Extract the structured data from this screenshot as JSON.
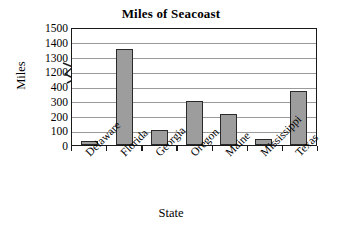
{
  "chart_data": {
    "type": "bar",
    "title": "Miles of Seacoast",
    "xlabel": "State",
    "ylabel": "Miles",
    "categories": [
      "Delaware",
      "Florida",
      "Georgia",
      "Oregon",
      "Maine",
      "Mississippi",
      "Texas"
    ],
    "values": [
      28,
      1350,
      100,
      296,
      210,
      44,
      367
    ],
    "series": [
      {
        "name": "Miles of Seacoast",
        "values": [
          28,
          1350,
          100,
          296,
          210,
          44,
          367
        ]
      }
    ],
    "ytick_labels": [
      "0",
      "100",
      "200",
      "300",
      "400",
      "1200",
      "1300",
      "1400",
      "1500"
    ],
    "ytick_values": [
      0,
      100,
      200,
      300,
      400,
      1200,
      1300,
      1400,
      1500
    ],
    "ylim": [
      0,
      1500
    ],
    "axis_break": {
      "present": true,
      "between": [
        400,
        1200
      ],
      "symbol": "zigzag"
    },
    "grid": true,
    "grid_orientation": "horizontal",
    "legend": "none",
    "bar_color": "#9d9d9d",
    "bar_border_color": "#2a2a2a",
    "axis_color": "#1a1a1a",
    "grid_color": "#9a9a9a",
    "background_color": "#ffffff",
    "label_rotation": -45
  }
}
